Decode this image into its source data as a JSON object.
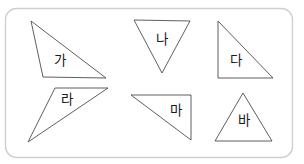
{
  "worksheet": {
    "title": "삼각형 분류 도형 모음",
    "background_color": "#ffffff",
    "frame": {
      "name": "rounded-frame",
      "x": 5.5,
      "y": 8.5,
      "width": 287,
      "height": 149,
      "rx": 11,
      "stroke_color": "#cfcfcf",
      "fill_color": "#ffffff"
    },
    "shape_stroke_color": "#4d4d4d",
    "label_color": "#1a1a1a"
  },
  "shapes": [
    {
      "id": "triangle-ga",
      "label": "가",
      "points": "31,21 43,77 106,78",
      "label_x": 60,
      "label_y": 61
    },
    {
      "id": "triangle-na",
      "label": "나",
      "points": "134,20 190,21 162,73",
      "label_x": 162,
      "label_y": 40
    },
    {
      "id": "triangle-da",
      "label": "다",
      "points": "218,21 218,78 273,78",
      "label_x": 236,
      "label_y": 61
    },
    {
      "id": "triangle-ra",
      "label": "라",
      "points": "55,88 108,88 28,142",
      "label_x": 67,
      "label_y": 100
    },
    {
      "id": "triangle-ma",
      "label": "마",
      "points": "131,95 191,95 191,140",
      "label_x": 176,
      "label_y": 111
    },
    {
      "id": "triangle-ba",
      "label": "바",
      "points": "243,93 272,141 215,141",
      "label_x": 244,
      "label_y": 121
    }
  ]
}
